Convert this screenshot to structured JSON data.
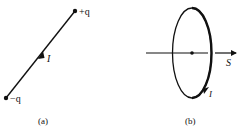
{
  "panel_a": {
    "caption": "(a)",
    "positive_charge": "+q",
    "negative_charge": "−q",
    "current_label": "I"
  },
  "panel_b": {
    "caption": "(b)",
    "current_label": "I",
    "surface_vector_label": "S"
  },
  "colors": {
    "ink": "#111111",
    "background": "#ffffff"
  }
}
